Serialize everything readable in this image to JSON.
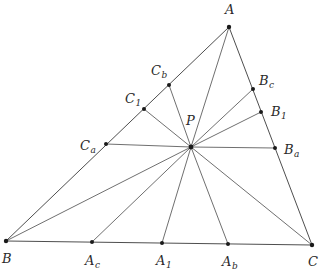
{
  "diagram": {
    "title": "",
    "vertices": {
      "A": {
        "x": 229,
        "y": 27
      },
      "B": {
        "x": 6,
        "y": 241
      },
      "C": {
        "x": 312,
        "y": 245
      }
    },
    "center": {
      "name": "P",
      "x": 191,
      "y": 147
    },
    "points": [
      {
        "id": "Cb",
        "base": "C",
        "sub": "b",
        "x": 169,
        "y": 85,
        "lx": 151,
        "ly": 75
      },
      {
        "id": "C1",
        "base": "C",
        "sub": "1",
        "x": 144,
        "y": 109,
        "lx": 125,
        "ly": 103
      },
      {
        "id": "Ca",
        "base": "C",
        "sub": "a",
        "x": 106,
        "y": 144,
        "lx": 80,
        "ly": 150
      },
      {
        "id": "Bc",
        "base": "B",
        "sub": "c",
        "x": 253,
        "y": 89,
        "lx": 259,
        "ly": 85
      },
      {
        "id": "B1",
        "base": "B",
        "sub": "1",
        "x": 261,
        "y": 112,
        "lx": 271,
        "ly": 116
      },
      {
        "id": "Ba",
        "base": "B",
        "sub": "a",
        "x": 275,
        "y": 148,
        "lx": 284,
        "ly": 154
      },
      {
        "id": "Ac",
        "base": "A",
        "sub": "c",
        "x": 92,
        "y": 242,
        "lx": 85,
        "ly": 265
      },
      {
        "id": "A1",
        "base": "A",
        "sub": "1",
        "x": 162,
        "y": 243,
        "lx": 156,
        "ly": 265
      },
      {
        "id": "Ab",
        "base": "A",
        "sub": "b",
        "x": 228,
        "y": 244,
        "lx": 222,
        "ly": 266
      }
    ],
    "labels": {
      "A": {
        "text": "A",
        "x": 225,
        "y": 14
      },
      "B": {
        "text": "B",
        "x": 2,
        "y": 263
      },
      "C": {
        "text": "C",
        "x": 308,
        "y": 266
      },
      "P": {
        "text": "P",
        "x": 186,
        "y": 125
      }
    },
    "segments_from_P": [
      "A",
      "B",
      "C",
      "Cb",
      "C1",
      "Ca",
      "Bc",
      "B1",
      "Ba",
      "Ac",
      "A1",
      "Ab"
    ]
  }
}
